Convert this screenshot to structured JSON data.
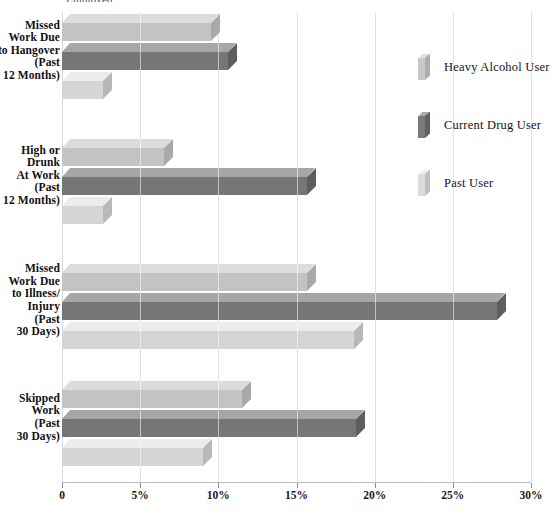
{
  "title_strip": "Employed",
  "chart_data": {
    "type": "bar",
    "orientation": "horizontal",
    "title": "",
    "xlabel": "",
    "ylabel": "",
    "xlim": [
      0,
      30
    ],
    "xticks": [
      0,
      5,
      10,
      15,
      20,
      25,
      30
    ],
    "xtick_labels": [
      "0",
      "5%",
      "10%",
      "15%",
      "20%",
      "25%",
      "30%"
    ],
    "grid": true,
    "legend_position": "right",
    "categories": [
      "Missed Work Due to Hangover (Past 12 Months)",
      "High or Drunk At Work (Past 12 Months)",
      "Missed Work Due to Illness/ Injury (Past 30 Days)",
      "Skipped Work (Past 30 Days)"
    ],
    "category_lines": [
      [
        "Missed",
        "Work Due",
        "to Hangover",
        "(Past",
        "12 Months)"
      ],
      [
        "High or",
        "Drunk",
        "At Work",
        "(Past",
        "12 Months)"
      ],
      [
        "Missed",
        "Work Due",
        "to Illness/",
        "Injury",
        "(Past",
        "30 Days)"
      ],
      [
        "Skipped",
        "Work",
        "(Past",
        "30 Days)"
      ]
    ],
    "series": [
      {
        "name": "Heavy Alcohol User",
        "color": "#c3c3c3",
        "values": [
          9.5,
          6.5,
          15.7,
          11.5
        ]
      },
      {
        "name": "Current Drug User",
        "color": "#767676",
        "values": [
          10.6,
          15.7,
          27.8,
          18.8
        ]
      },
      {
        "name": "Past User",
        "color": "#d5d5d5",
        "values": [
          2.6,
          2.6,
          18.7,
          9.0
        ]
      }
    ]
  },
  "legend": {
    "items": [
      {
        "label": "Heavy Alcohol User"
      },
      {
        "label": "Current Drug User"
      },
      {
        "label": "Past User"
      }
    ]
  }
}
